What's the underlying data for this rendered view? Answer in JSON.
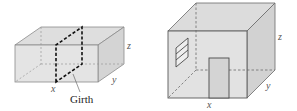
{
  "figures": {
    "left": {
      "name": "package-box",
      "labels": {
        "x": "x",
        "y": "y",
        "z": "z",
        "girth": "Girth"
      }
    },
    "right": {
      "name": "room-box",
      "labels": {
        "x": "x",
        "y": "y",
        "z": "z"
      }
    }
  },
  "colors": {
    "face_fill": "#e2e2e2",
    "face_side": "#d6d6d6",
    "face_top": "#dcdcdc",
    "edge": "#7a7a7a",
    "dashed_girth": "#111111",
    "door_fill": "#cfcfcf"
  }
}
